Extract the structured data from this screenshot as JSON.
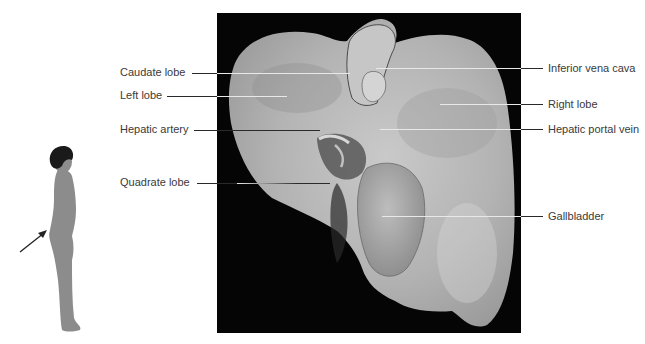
{
  "diagram": {
    "labels_left": [
      {
        "text": "Caudate lobe",
        "x": 120,
        "y": 66,
        "line_y": 73,
        "line_start": 192,
        "line_end": 350
      },
      {
        "text": "Left lobe",
        "x": 120,
        "y": 89,
        "line_y": 96,
        "line_start": 167,
        "line_end": 287
      },
      {
        "text": "Hepatic artery",
        "x": 120,
        "y": 123,
        "line_y": 130,
        "line_start": 194,
        "line_end": 320
      },
      {
        "text": "Quadrate lobe",
        "x": 120,
        "y": 176,
        "line_y": 183,
        "line_start": 197,
        "line_end": 330
      }
    ],
    "labels_right": [
      {
        "text": "Inferior vena cava",
        "x": 548,
        "y": 62,
        "line_y": 68,
        "line_start": 376,
        "line_end": 543
      },
      {
        "text": "Right lobe",
        "x": 548,
        "y": 99,
        "line_y": 104,
        "line_start": 440,
        "line_end": 543
      },
      {
        "text": "Hepatic portal vein",
        "x": 548,
        "y": 123,
        "line_y": 129,
        "line_start": 380,
        "line_end": 543
      },
      {
        "text": "Gallbladder",
        "x": 548,
        "y": 210,
        "line_y": 216,
        "line_start": 382,
        "line_end": 543
      }
    ],
    "orientation_figure": {
      "description": "Standing human silhouette, side view, with arrow pointing to abdomen",
      "arrow_direction": "up-right"
    },
    "colors": {
      "background": "#ffffff",
      "photo_background": "#050505",
      "organ_light": "#cfcfcf",
      "organ_mid": "#a9a9a9",
      "organ_dark": "#6e6e6e",
      "figure_fill": "#8c8c8c",
      "hair": "#1a1a1a",
      "label_text": "#3a3a3a"
    }
  }
}
